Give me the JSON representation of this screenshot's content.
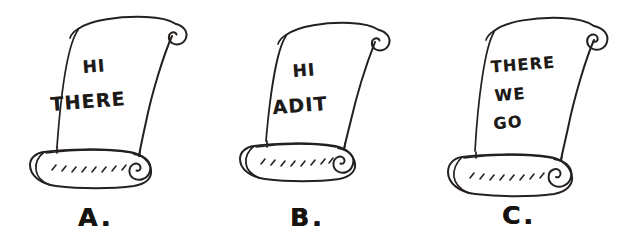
{
  "figure": {
    "background_color": "#ffffff",
    "ink_color": "#24201e",
    "style": "hand-drawn black ink line art on white"
  },
  "scrolls": [
    {
      "id": "scroll-a",
      "label": "A.",
      "lines": [
        "HI",
        "THERE"
      ],
      "line_sizes": [
        17,
        19
      ],
      "line_positions": [
        {
          "left": 34,
          "top": 58,
          "width": 120
        },
        {
          "left": 18,
          "top": 92,
          "width": 140
        }
      ],
      "label_position": {
        "left": 78,
        "top": 203
      }
    },
    {
      "id": "scroll-b",
      "label": "B.",
      "lines": [
        "HI",
        "ADIT"
      ],
      "line_sizes": [
        17,
        19
      ],
      "line_positions": [
        {
          "left": 30,
          "top": 62,
          "width": 120
        },
        {
          "left": 16,
          "top": 96,
          "width": 140
        }
      ],
      "label_position": {
        "left": 76,
        "top": 203
      }
    },
    {
      "id": "scroll-c",
      "label": "C.",
      "lines": [
        "THERE",
        "WE",
        "GO"
      ],
      "line_sizes": [
        16,
        16,
        16
      ],
      "line_positions": [
        {
          "left": 28,
          "top": 57,
          "width": 134
        },
        {
          "left": 22,
          "top": 87,
          "width": 120
        },
        {
          "left": 20,
          "top": 115,
          "width": 120
        }
      ],
      "label_position": {
        "left": 74,
        "top": 201
      }
    }
  ],
  "icons": {
    "scroll": "scroll-icon",
    "curl": "paper-curl-icon",
    "roll": "paper-roll-icon"
  }
}
